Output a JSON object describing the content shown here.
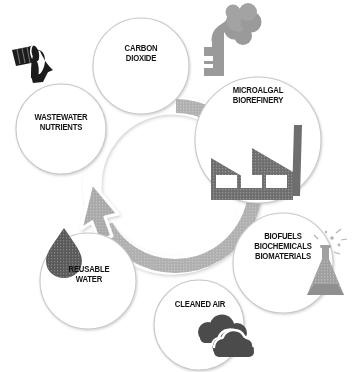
{
  "diagram": {
    "type": "cycle-diagram",
    "background_color": "#ffffff",
    "ring": {
      "name": "circular-arrow-ring",
      "color": "#b0b0b0",
      "outline_color": "#ffffff",
      "direction": "counter-clockwise",
      "arrow_head_position": "upper-left"
    },
    "nodes": [
      {
        "id": "carbon-dioxide",
        "label": "CARBON\nDIOXIDE",
        "icon": "smokestack-icon",
        "icon_color": "#9a9a9a",
        "circle_fill": "#ffffff",
        "circle_stroke": "#c9c9c9"
      },
      {
        "id": "wastewater-nutrients",
        "label": "WASTEWATER\nNUTRIENTS",
        "icon": "discharge-pipe-icon",
        "icon_color": "#1c1c1c",
        "circle_fill": "#ffffff",
        "circle_stroke": "#c9c9c9"
      },
      {
        "id": "microalgal-biorefinery",
        "label": "MICROALGAL\nBIOREFINERY",
        "icon": "factory-icon",
        "icon_color": "#6e6e6e",
        "circle_fill": "#ffffff",
        "circle_stroke": "#c9c9c9"
      },
      {
        "id": "biofuels-biochemicals-biomaterials",
        "label": "BIOFUELS\nBIOCHEMICALS\nBIOMATERIALS",
        "icon": "flask-icon",
        "icon_color": "#a0a0a0",
        "circle_fill": "#ffffff",
        "circle_stroke": "#c9c9c9"
      },
      {
        "id": "cleaned-air",
        "label": "CLEANED AIR",
        "icon": "clouds-icon",
        "icon_color": "#4b4b4b",
        "circle_fill": "#ffffff",
        "circle_stroke": "#c9c9c9"
      },
      {
        "id": "reusable-water",
        "label": "REUSABLE\nWATER",
        "icon": "water-droplet-icon",
        "icon_color": "#5a5a5a",
        "circle_fill": "#ffffff",
        "circle_stroke": "#c9c9c9"
      }
    ]
  }
}
